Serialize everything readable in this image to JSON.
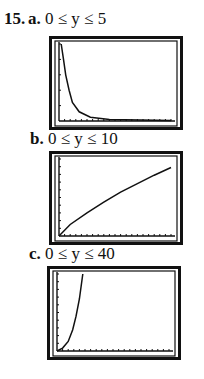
{
  "problem": {
    "number": "15."
  },
  "chart_data": [
    {
      "type": "line",
      "part": "a.",
      "title": "0 ≤ y ≤ 5",
      "ylim": [
        0,
        5
      ],
      "xlabel": "",
      "ylabel": "",
      "description": "steep decaying curve near y-axis approaching 0",
      "points": [
        [
          0.02,
          5
        ],
        [
          0.04,
          4.0
        ],
        [
          0.06,
          3.0
        ],
        [
          0.09,
          2.0
        ],
        [
          0.12,
          1.2
        ],
        [
          0.18,
          0.6
        ],
        [
          0.28,
          0.25
        ],
        [
          0.45,
          0.1
        ],
        [
          1,
          0.03
        ]
      ]
    },
    {
      "type": "line",
      "part": "b.",
      "title": "0 ≤ y ≤ 10",
      "ylim": [
        0,
        10
      ],
      "xlabel": "",
      "ylabel": "",
      "description": "concave increasing curve from origin",
      "points": [
        [
          0,
          0
        ],
        [
          0.1,
          1.5
        ],
        [
          0.25,
          3.0
        ],
        [
          0.4,
          4.4
        ],
        [
          0.55,
          5.7
        ],
        [
          0.7,
          6.8
        ],
        [
          0.85,
          7.9
        ],
        [
          1,
          8.9
        ]
      ]
    },
    {
      "type": "line",
      "part": "c.",
      "title": "0 ≤ y ≤ 40",
      "ylim": [
        0,
        40
      ],
      "xlabel": "",
      "ylabel": "",
      "description": "convex increasing curve from origin, exits top early",
      "points": [
        [
          0,
          0
        ],
        [
          0.05,
          1.5
        ],
        [
          0.1,
          5
        ],
        [
          0.14,
          11
        ],
        [
          0.17,
          18
        ],
        [
          0.2,
          27
        ],
        [
          0.23,
          40
        ]
      ]
    }
  ]
}
